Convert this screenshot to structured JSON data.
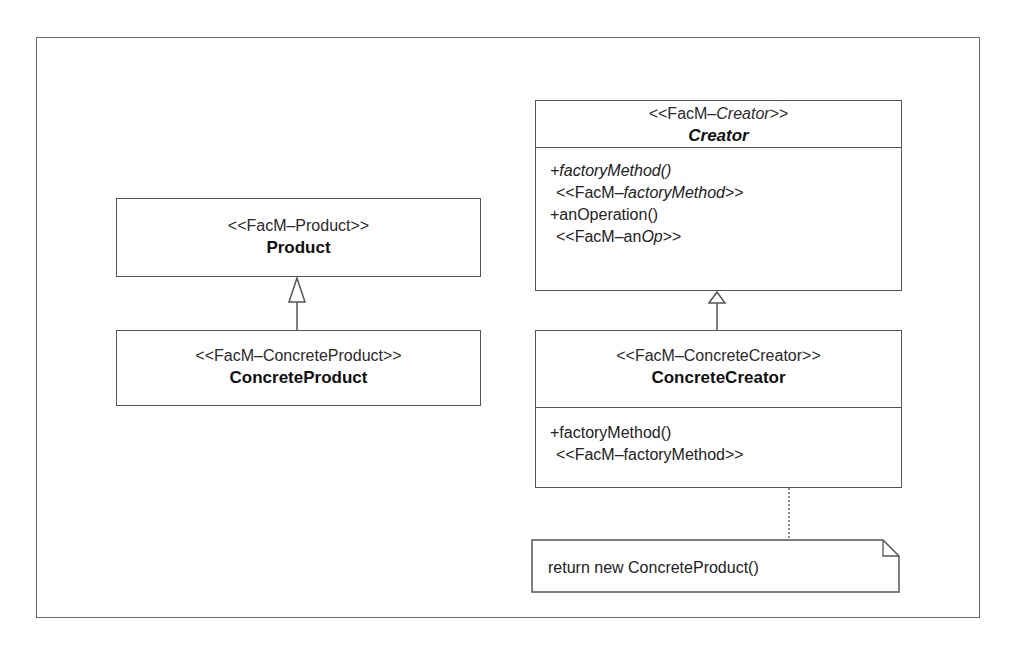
{
  "diagram": {
    "type": "UML class diagram",
    "pattern": "Factory Method",
    "colors": {
      "line": "#555555",
      "frame": "#6a6a6a",
      "background": "#ffffff",
      "text": "#222222"
    }
  },
  "classes": {
    "creator": {
      "stereotype_prefix": "<<FacM–",
      "stereotype_italic": "Creator",
      "stereotype_suffix": ">>",
      "name": "Creator",
      "name_italic": true,
      "operations": [
        {
          "signature": "+factoryMethod()",
          "italic": true
        },
        {
          "stereotype_prefix": " <<FacM–",
          "stereotype_italic": "factoryMethod",
          "stereotype_suffix": ">>"
        },
        {
          "signature": "+anOperation()",
          "italic": false
        },
        {
          "stereotype_prefix": " <<FacM–an",
          "stereotype_italic": "Op",
          "stereotype_suffix": ">>"
        }
      ]
    },
    "product": {
      "stereotype": "<<FacM–Product>>",
      "name": "Product"
    },
    "concrete_product": {
      "stereotype": "<<FacM–ConcreteProduct>>",
      "name": "ConcreteProduct"
    },
    "concrete_creator": {
      "stereotype": "<<FacM–ConcreteCreator>>",
      "name": "ConcreteCreator",
      "operations": [
        {
          "signature": "+factoryMethod()"
        },
        {
          "stereotype": " <<FacM–factoryMethod>>"
        }
      ]
    }
  },
  "relationships": [
    {
      "type": "generalization",
      "from": "ConcreteProduct",
      "to": "Product"
    },
    {
      "type": "generalization",
      "from": "ConcreteCreator",
      "to": "Creator"
    },
    {
      "type": "note-anchor",
      "from": "ConcreteCreator",
      "to": "note"
    }
  ],
  "note": {
    "text": "return new ConcreteProduct()"
  }
}
